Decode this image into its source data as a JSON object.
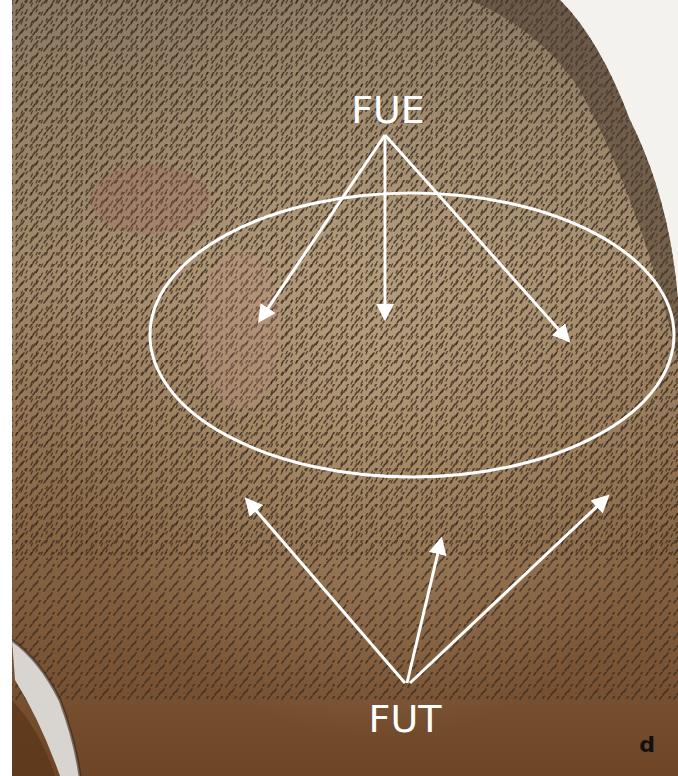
{
  "figure": {
    "panel_label": "d",
    "labels": {
      "top": "FUE",
      "bottom": "FUT"
    },
    "annotations": {
      "ellipse": {
        "cx": 412,
        "cy": 335,
        "rx": 262,
        "ry": 142
      },
      "fue_origin": [
        385,
        135
      ],
      "fue_targets": [
        [
          257,
          325
        ],
        [
          385,
          322
        ],
        [
          572,
          345
        ]
      ],
      "fut_origin": [
        407,
        683
      ],
      "fut_targets": [
        [
          243,
          495
        ],
        [
          443,
          535
        ],
        [
          612,
          493
        ]
      ]
    },
    "colors": {
      "annotation": "#ffffff",
      "scalp_light": "#b49c78",
      "scalp_dark": "#5e4a38",
      "skin_lower": "#7a4e2a",
      "background": "#f4f2ee",
      "panel_label": "#111111"
    }
  }
}
